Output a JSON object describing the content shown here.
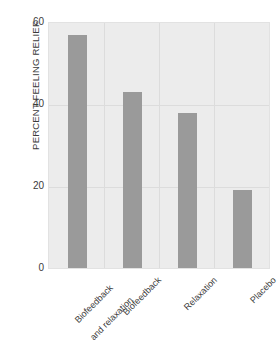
{
  "chart_data": {
    "type": "bar",
    "title": "",
    "xlabel": "",
    "ylabel": "PERCENT FEELING RELIEF",
    "categories": [
      "Biofeedback\nand relaxation",
      "Biofeedback",
      "Relaxation",
      "Placebo"
    ],
    "values": [
      57,
      43,
      38,
      19
    ],
    "ylim": [
      0,
      60
    ],
    "yticks": [
      0,
      20,
      40,
      60
    ],
    "ytick_labels": [
      "0",
      "20",
      "40",
      "60"
    ],
    "grid": "both",
    "legend": "none",
    "bar_color": "#9a9a9a",
    "plot_background": "#ececec",
    "gridline_color": "#dcdcdc",
    "figure_background": "#ffffff"
  },
  "axis": {
    "y_title": "PERCENT FEELING RELIEF",
    "tick_60": "60",
    "tick_40": "40",
    "tick_20": "20",
    "tick_0": "0"
  },
  "categories": {
    "c0_line1": "Biofeedback",
    "c0_line2": "and relaxation",
    "c1": "Biofeedback",
    "c2": "Relaxation",
    "c3": "Placebo"
  }
}
